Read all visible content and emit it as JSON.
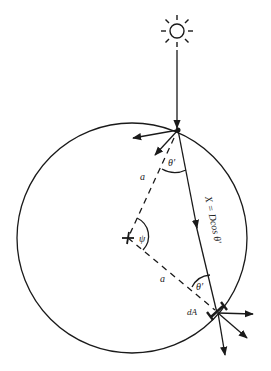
{
  "diagram": {
    "labels": {
      "a_upper": "a",
      "a_lower": "a",
      "theta_top": "θ′",
      "theta_bottom": "θ′",
      "psi": "ψ",
      "chord": "X = Dcos θ′",
      "dA": "dA"
    },
    "elements": {
      "sun": "sun-icon",
      "sphere": "circle",
      "center": "center-marker",
      "incident_ray": "arrow-down",
      "chord_ray": "arrow"
    },
    "colors": {
      "stroke": "#1a1a1a",
      "background": "#ffffff"
    }
  }
}
